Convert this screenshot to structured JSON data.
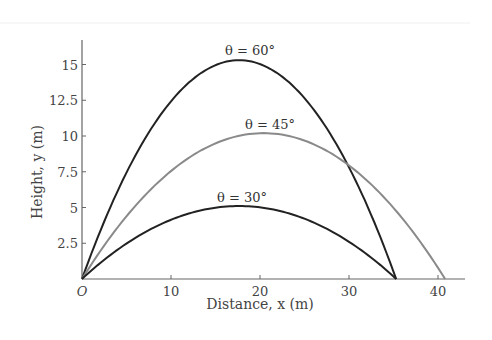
{
  "chart_data": {
    "type": "line",
    "title": "",
    "xlabel": "Distance, x (m)",
    "ylabel": "Height, y (m)",
    "xlim": [
      0,
      43
    ],
    "ylim": [
      0,
      17
    ],
    "x_ticks": [
      0,
      10,
      20,
      30,
      40
    ],
    "x_tick_labels": [
      "O",
      "10",
      "20",
      "30",
      "40"
    ],
    "y_ticks": [
      2.5,
      5,
      7.5,
      10,
      12.5,
      15
    ],
    "y_tick_labels": [
      "2.5",
      "5",
      "7.5",
      "10",
      "12.5",
      "15"
    ],
    "grid": false,
    "legend": "inline labels",
    "series": [
      {
        "name": "θ = 60°",
        "label": "θ = 60°",
        "color": "#222222",
        "range": 35.3,
        "max_height": 15.3,
        "peak_x": 17.65
      },
      {
        "name": "θ = 45°",
        "label": "θ = 45°",
        "color": "#8a8a8a",
        "range": 40.8,
        "max_height": 10.2,
        "peak_x": 20.4
      },
      {
        "name": "θ = 30°",
        "label": "θ = 30°",
        "color": "#222222",
        "range": 35.3,
        "max_height": 5.1,
        "peak_x": 17.65
      }
    ]
  }
}
